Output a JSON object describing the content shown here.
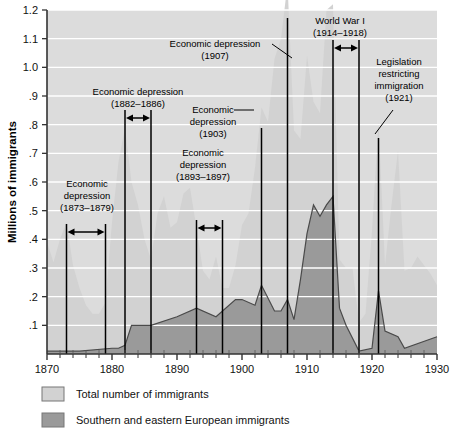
{
  "chart_data": {
    "type": "area",
    "title": "",
    "xlabel": "",
    "ylabel": "Millions of immigrants",
    "xlim": [
      1870,
      1930
    ],
    "ylim": [
      0,
      1.2
    ],
    "grid": true,
    "legend_position": "below-plot-left",
    "x_ticks": [
      "1870",
      "1880",
      "1890",
      "1900",
      "1910",
      "1920",
      "1930"
    ],
    "x_tick_values": [
      1870,
      1880,
      1890,
      1900,
      1910,
      1920,
      1930
    ],
    "x_minor_interval": 2,
    "y_ticks": [
      "1.2",
      "1.1",
      "1.0",
      ".9",
      ".8",
      ".7",
      ".6",
      ".5",
      ".4",
      ".3",
      ".2",
      ".1"
    ],
    "y_tick_values": [
      1.2,
      1.1,
      1.0,
      0.9,
      0.8,
      0.7,
      0.6,
      0.5,
      0.4,
      0.3,
      0.2,
      0.1
    ],
    "series": [
      {
        "name": "Total number of immigrants",
        "color": "#d2d2d2",
        "x": [
          1870,
          1871,
          1872,
          1873,
          1874,
          1875,
          1876,
          1877,
          1878,
          1879,
          1880,
          1881,
          1882,
          1883,
          1884,
          1885,
          1886,
          1887,
          1888,
          1889,
          1890,
          1891,
          1892,
          1893,
          1894,
          1895,
          1896,
          1897,
          1898,
          1899,
          1900,
          1901,
          1902,
          1903,
          1904,
          1905,
          1906,
          1907,
          1908,
          1909,
          1910,
          1911,
          1912,
          1913,
          1914,
          1915,
          1916,
          1917,
          1918,
          1919,
          1920,
          1921,
          1922,
          1923,
          1924,
          1925,
          1926,
          1927,
          1928,
          1929,
          1930
        ],
        "values": [
          0.39,
          0.32,
          0.4,
          0.46,
          0.31,
          0.23,
          0.17,
          0.14,
          0.14,
          0.18,
          0.46,
          0.67,
          0.79,
          0.6,
          0.52,
          0.4,
          0.33,
          0.49,
          0.55,
          0.44,
          0.46,
          0.56,
          0.58,
          0.44,
          0.29,
          0.26,
          0.34,
          0.23,
          0.23,
          0.31,
          0.45,
          0.49,
          0.65,
          0.86,
          0.81,
          1.03,
          1.1,
          1.29,
          0.78,
          0.75,
          1.04,
          0.88,
          0.84,
          1.2,
          1.22,
          0.33,
          0.3,
          0.3,
          0.11,
          0.14,
          0.43,
          0.81,
          0.31,
          0.52,
          0.71,
          0.29,
          0.3,
          0.34,
          0.31,
          0.28,
          0.24
        ]
      },
      {
        "name": "Southern and eastern European immigrants",
        "color": "#9a9a9a",
        "x": [
          1870,
          1875,
          1880,
          1881,
          1882,
          1883,
          1886,
          1890,
          1893,
          1896,
          1899,
          1900,
          1902,
          1903,
          1905,
          1906,
          1907,
          1908,
          1909,
          1910,
          1911,
          1912,
          1913,
          1914,
          1915,
          1916,
          1918,
          1920,
          1921,
          1922,
          1924,
          1925,
          1930
        ],
        "values": [
          0.01,
          0.01,
          0.02,
          0.02,
          0.03,
          0.1,
          0.1,
          0.13,
          0.16,
          0.13,
          0.19,
          0.19,
          0.17,
          0.24,
          0.15,
          0.15,
          0.19,
          0.12,
          0.26,
          0.42,
          0.52,
          0.48,
          0.52,
          0.55,
          0.16,
          0.1,
          0.01,
          0.02,
          0.22,
          0.08,
          0.06,
          0.02,
          0.06
        ]
      }
    ],
    "annotations": [
      {
        "id": "depression-1873",
        "lines": [
          "Economic",
          "depression",
          "(1873–1879)"
        ],
        "span_start": 1873,
        "span_end": 1879,
        "marker": "double-arrow-span"
      },
      {
        "id": "depression-1882",
        "lines": [
          "Economic depression",
          "(1882–1886)"
        ],
        "span_start": 1882,
        "span_end": 1886,
        "marker": "double-arrow-span"
      },
      {
        "id": "depression-1893",
        "lines": [
          "Economic",
          "depression",
          "(1893–1897)"
        ],
        "span_start": 1893,
        "span_end": 1897,
        "marker": "double-arrow-span"
      },
      {
        "id": "depression-1903",
        "lines": [
          "Economic",
          "depression",
          "(1903)"
        ],
        "span_start": 1903,
        "span_end": 1903,
        "marker": "leader-line"
      },
      {
        "id": "depression-1907",
        "lines": [
          "Economic depression",
          "(1907)"
        ],
        "span_start": 1907,
        "span_end": 1907,
        "marker": "leader-line"
      },
      {
        "id": "world-war-one",
        "lines": [
          "World War I",
          "(1914–1918)"
        ],
        "span_start": 1914,
        "span_end": 1918,
        "marker": "double-arrow-span"
      },
      {
        "id": "legislation-1921",
        "lines": [
          "Legislation",
          "restricting",
          "immigration",
          "(1921)"
        ],
        "span_start": 1921,
        "span_end": 1921,
        "marker": "leader-line"
      }
    ]
  },
  "axis": {
    "y_title": "Millions of immigrants",
    "y_labels": [
      "1.2",
      "1.1",
      "1.0",
      ".9",
      ".8",
      ".7",
      ".6",
      ".5",
      ".4",
      ".3",
      ".2",
      ".1"
    ],
    "x_labels": [
      "1870",
      "1880",
      "1890",
      "1900",
      "1910",
      "1920",
      "1930"
    ]
  },
  "annotations_text": {
    "depression_1873": {
      "l1": "Economic",
      "l2": "depression",
      "l3": "(1873–1879)"
    },
    "depression_1882": {
      "l1": "Economic depression",
      "l2": "(1882–1886)"
    },
    "depression_1893": {
      "l1": "Economic",
      "l2": "depression",
      "l3": "(1893–1897)"
    },
    "depression_1903": {
      "l1": "Economic",
      "l2": "depression",
      "l3": "(1903)"
    },
    "depression_1907": {
      "l1": "Economic depression",
      "l2": "(1907)"
    },
    "world_war_one": {
      "l1": "World War I",
      "l2": "(1914–1918)"
    },
    "legislation_1921": {
      "l1": "Legislation",
      "l2": "restricting",
      "l3": "immigration",
      "l4": "(1921)"
    }
  },
  "legend": {
    "items": [
      {
        "label": "Total number of immigrants",
        "color": "#d2d2d2"
      },
      {
        "label": "Southern and eastern European immigrants",
        "color": "#9a9a9a"
      }
    ]
  },
  "colors": {
    "total_area": "#d2d2d2",
    "southern_eastern_area": "#9a9a9a",
    "plot_background": "#dcdcdc",
    "gridline": "#ffffff",
    "axis": "#333333",
    "annotation_line": "#000000"
  }
}
